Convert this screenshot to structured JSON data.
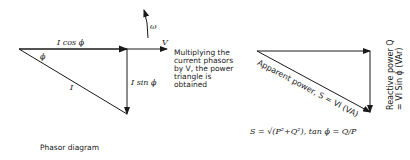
{
  "phasor_diagram": {
    "caption": "Phasor diagram",
    "labels": {
      "in_phase": "I cos ϕ",
      "quadrature": "I sin ϕ",
      "current": "I",
      "voltage": "V",
      "angle": "ϕ",
      "rotation": "ω"
    },
    "note": "Multiplying the\ncurrent phasors\nby V, the power\ntriangle is\nobtained"
  },
  "power_triangle": {
    "apparent_label": "Apparent power, S = VI (VA)",
    "reactive_label_line1": "Reactive power Q",
    "reactive_label_line2": "= VI Sin ϕ (VAr)",
    "formula": "S = √(P²+Q²), tan ϕ = Q/P"
  }
}
